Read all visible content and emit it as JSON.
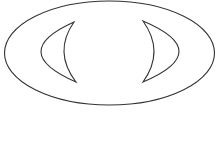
{
  "diagram": {
    "background": "#ffffff",
    "stroke_color": "#333333",
    "shapes": [
      {
        "id": "outer-ellipse",
        "type": "ellipse",
        "cx": 109.5,
        "cy": 53,
        "rx": 105,
        "ry": 52
      },
      {
        "id": "left-crescent",
        "type": "crescent",
        "orientation": "left",
        "top": [
          74,
          22
        ],
        "bottom": [
          76,
          82
        ],
        "outer_extreme_x": 41,
        "inner_extreme_x": 64
      },
      {
        "id": "right-crescent",
        "type": "crescent",
        "orientation": "right",
        "top": [
          143,
          21
        ],
        "bottom": [
          143,
          82
        ],
        "outer_extreme_x": 179,
        "inner_extreme_x": 154
      }
    ]
  }
}
